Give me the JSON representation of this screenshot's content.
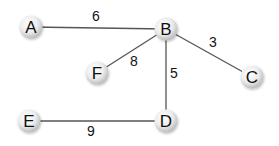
{
  "diagram": {
    "type": "weighted-undirected-graph",
    "nodes": [
      {
        "id": "A",
        "label": "A",
        "x": 31,
        "y": 27
      },
      {
        "id": "B",
        "label": "B",
        "x": 166,
        "y": 29
      },
      {
        "id": "C",
        "label": "C",
        "x": 252,
        "y": 77
      },
      {
        "id": "F",
        "label": "F",
        "x": 97,
        "y": 73
      },
      {
        "id": "D",
        "label": "D",
        "x": 166,
        "y": 121
      },
      {
        "id": "E",
        "label": "E",
        "x": 29,
        "y": 121
      }
    ],
    "edges": [
      {
        "from": "A",
        "to": "B",
        "weight": "6",
        "lx": 96,
        "ly": 21
      },
      {
        "from": "B",
        "to": "C",
        "weight": "3",
        "lx": 213,
        "ly": 47
      },
      {
        "from": "B",
        "to": "F",
        "weight": "8",
        "lx": 134,
        "ly": 66
      },
      {
        "from": "B",
        "to": "D",
        "weight": "5",
        "lx": 174,
        "ly": 78
      },
      {
        "from": "E",
        "to": "D",
        "weight": "9",
        "lx": 91,
        "ly": 136
      }
    ]
  }
}
